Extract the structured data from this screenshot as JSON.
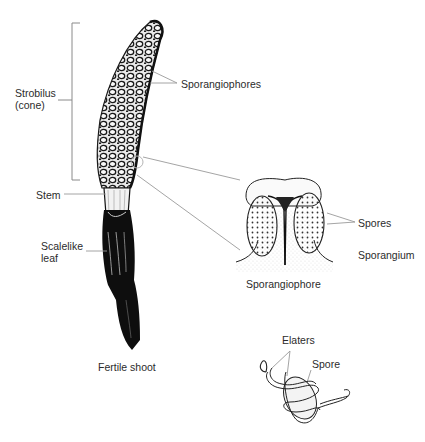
{
  "figure": {
    "colors": {
      "ink": "#111111",
      "leader_line": "#9a9a9a",
      "label_text": "#2b2b2b",
      "background": "#ffffff"
    }
  },
  "labels": {
    "strobilus_line1": "Strobilus",
    "strobilus_line2": "(cone)",
    "sporangiophores": "Sporangiophores",
    "stem": "Stem",
    "scalelike_leaf_line1": "Scalelike",
    "scalelike_leaf_line2": "leaf",
    "fertile_shoot": "Fertile shoot",
    "spores": "Spores",
    "sporangium": "Sporangium",
    "sporangiophore": "Sporangiophore",
    "elaters": "Elaters",
    "spore": "Spore"
  }
}
